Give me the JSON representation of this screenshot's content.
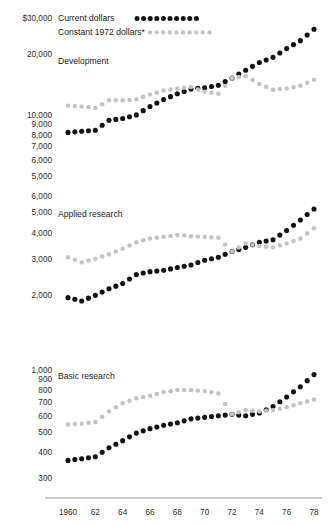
{
  "legend": {
    "items": [
      {
        "label": "Current dollars",
        "color": "#111111",
        "marker": "filled-dot"
      },
      {
        "label": "Constant 1972 dollars*",
        "color": "#c3c3c3",
        "marker": "light-dot"
      }
    ]
  },
  "panels": [
    {
      "name": "Development",
      "label": "Development"
    },
    {
      "name": "Applied research",
      "label": "Applied research"
    },
    {
      "name": "Basic research",
      "label": "Basic research"
    }
  ],
  "axis": {
    "x_ticks": [
      "1960",
      "62",
      "64",
      "66",
      "68",
      "70",
      "72",
      "74",
      "76",
      "78"
    ],
    "x_tick_years": [
      1960,
      1962,
      1964,
      1966,
      1968,
      1970,
      1972,
      1974,
      1976,
      1978
    ],
    "y_ticks_development": [
      "$30,000",
      "20,000",
      "10,000",
      "9,000",
      "8,000",
      "7,000",
      "6,000",
      "5,000"
    ],
    "y_ticks_applied": [
      "6,000",
      "5,000",
      "4,000",
      "3,000",
      "2,000"
    ],
    "y_ticks_basic": [
      "1,000",
      "900",
      "800",
      "700",
      "600",
      "500",
      "400",
      "300"
    ],
    "scale": "log"
  },
  "chart_data": {
    "type": "scatter",
    "title": "",
    "subtitle": "",
    "xlabel": "",
    "ylabel": "",
    "scale": "log",
    "grid": false,
    "legend_position": "top-left",
    "x": [
      1960,
      1961,
      1962,
      1963,
      1964,
      1965,
      1966,
      1967,
      1968,
      1969,
      1970,
      1971,
      1972,
      1973,
      1974,
      1975,
      1976,
      1977,
      1978
    ],
    "panels": [
      {
        "name": "Development",
        "ylim": [
          5000,
          33000
        ],
        "yticks": [
          5000,
          6000,
          7000,
          8000,
          9000,
          10000,
          20000,
          30000
        ],
        "ytick_labels": [
          "5,000",
          "6,000",
          "7,000",
          "8,000",
          "9,000",
          "10,000",
          "20,000",
          "$30,000"
        ],
        "series": [
          {
            "name": "Current dollars",
            "color": "#111111",
            "values": [
              8200,
              8300,
              8400,
              9400,
              9600,
              10000,
              11000,
              11900,
              12700,
              13400,
              13600,
              14000,
              15200,
              16600,
              18100,
              19200,
              21200,
              23200,
              26400
            ]
          },
          {
            "name": "Constant 1972 dollars*",
            "color": "#c3c3c3",
            "values": [
              11100,
              11000,
              10800,
              11800,
              11800,
              11900,
              12600,
              13200,
              13500,
              13700,
              13000,
              12700,
              15200,
              15500,
              14200,
              13300,
              13500,
              13900,
              14900
            ]
          }
        ]
      },
      {
        "name": "Applied research",
        "ylim": [
          1800,
          6200
        ],
        "yticks": [
          2000,
          3000,
          4000,
          5000,
          6000
        ],
        "ytick_labels": [
          "2,000",
          "3,000",
          "4,000",
          "5,000",
          "6,000"
        ],
        "series": [
          {
            "name": "Current dollars",
            "color": "#111111",
            "values": [
              1950,
              1880,
              2000,
              2150,
              2280,
              2520,
              2600,
              2640,
              2720,
              2800,
              2950,
              3050,
              3250,
              3400,
              3600,
              3700,
              4100,
              4600,
              5200
            ]
          },
          {
            "name": "Constant 1972 dollars*",
            "color": "#c3c3c3",
            "values": [
              3050,
              2880,
              3000,
              3150,
              3350,
              3600,
              3750,
              3820,
              3900,
              3850,
              3820,
              3780,
              3250,
              3550,
              3450,
              3400,
              3550,
              3750,
              4200
            ]
          }
        ]
      },
      {
        "name": "Basic research",
        "ylim": [
          290,
          1050
        ],
        "yticks": [
          300,
          400,
          500,
          600,
          700,
          800,
          900,
          1000
        ],
        "ytick_labels": [
          "300",
          "400",
          "500",
          "600",
          "700",
          "800",
          "900",
          "1,000"
        ],
        "series": [
          {
            "name": "Current dollars",
            "color": "#111111",
            "values": [
              365,
              372,
              380,
              420,
              455,
              495,
              520,
              540,
              555,
              580,
              590,
              600,
              610,
              600,
              620,
              665,
              740,
              830,
              950
            ]
          },
          {
            "name": "Constant 1972 dollars*",
            "color": "#c3c3c3",
            "values": [
              545,
              550,
              560,
              630,
              690,
              730,
              750,
              780,
              800,
              800,
              790,
              770,
              610,
              640,
              630,
              640,
              660,
              690,
              720
            ]
          }
        ]
      }
    ]
  }
}
